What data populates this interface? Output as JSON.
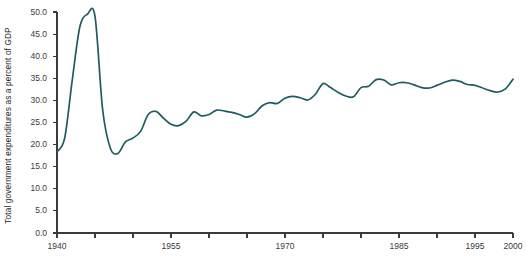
{
  "chart_data": {
    "type": "line",
    "title": "",
    "subtitle": "",
    "xlabel": "",
    "ylabel": "Total government expenditures as a percent of GDP",
    "xlim": [
      1940,
      2000
    ],
    "ylim": [
      0.0,
      50.0
    ],
    "grid": false,
    "legend": null,
    "line_color": "#1d5c60",
    "axis_color": "#3a3a3a",
    "background": "#ffffff",
    "ytick_labels": [
      "50.0",
      "45.0",
      "40.0",
      "35.0",
      "30.0",
      "25.0",
      "20.0",
      "15.0",
      "10.0",
      "5.0",
      "0.0"
    ],
    "ytick_values": [
      50.0,
      45.0,
      40.0,
      35.0,
      30.0,
      25.0,
      20.0,
      15.0,
      10.0,
      5.0,
      0.0
    ],
    "xtick_values": [
      1940,
      1945,
      1950,
      1955,
      1960,
      1965,
      1970,
      1975,
      1980,
      1985,
      1990,
      1995,
      2000
    ],
    "xtick_labels": [
      "1940",
      "",
      "",
      "1955",
      "",
      "",
      "1970",
      "",
      "",
      "1985",
      "",
      "1995",
      "2000"
    ],
    "series": [
      {
        "name": "Total government expenditures",
        "x": [
          1940,
          1941,
          1942,
          1943,
          1944,
          1945,
          1946,
          1947,
          1948,
          1949,
          1950,
          1951,
          1952,
          1953,
          1954,
          1955,
          1956,
          1957,
          1958,
          1959,
          1960,
          1961,
          1962,
          1963,
          1964,
          1965,
          1966,
          1967,
          1968,
          1969,
          1970,
          1971,
          1972,
          1973,
          1974,
          1975,
          1976,
          1977,
          1978,
          1979,
          1980,
          1981,
          1982,
          1983,
          1984,
          1985,
          1986,
          1987,
          1988,
          1989,
          1990,
          1991,
          1992,
          1993,
          1994,
          1995,
          1996,
          1997,
          1998,
          1999,
          2000
        ],
        "y": [
          18.4,
          21.4,
          34.5,
          46.6,
          49.5,
          49.0,
          28.0,
          19.3,
          18.0,
          20.6,
          21.5,
          23.0,
          26.8,
          27.5,
          26.0,
          24.6,
          24.3,
          25.3,
          27.4,
          26.5,
          26.8,
          27.8,
          27.6,
          27.3,
          26.8,
          26.2,
          27.0,
          28.8,
          29.5,
          29.3,
          30.5,
          30.9,
          30.6,
          30.1,
          31.4,
          33.8,
          32.9,
          31.8,
          31.0,
          30.8,
          32.9,
          33.2,
          34.7,
          34.6,
          33.5,
          34.0,
          34.0,
          33.5,
          32.9,
          32.8,
          33.4,
          34.1,
          34.6,
          34.3,
          33.6,
          33.4,
          32.8,
          32.2,
          31.9,
          32.6,
          34.8
        ]
      }
    ]
  },
  "footnote": {
    "text": ""
  }
}
